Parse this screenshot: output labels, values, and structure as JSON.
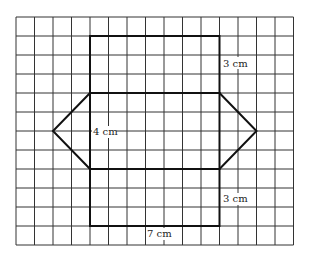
{
  "grid": {
    "columns": 15,
    "rows": 12,
    "origin_x": 16,
    "origin_y": 17,
    "cell_w": 18.5,
    "cell_h": 19,
    "line_color": "#333333"
  },
  "net": {
    "line_color": "#111111",
    "top_rect": {
      "col": 4,
      "row": 1,
      "w": 7,
      "h": 3
    },
    "middle_rect": {
      "col": 4,
      "row": 4,
      "w": 7,
      "h": 4
    },
    "bottom_rect": {
      "col": 4,
      "row": 8,
      "w": 7,
      "h": 3
    },
    "left_apex": {
      "col": 2,
      "row": 6
    },
    "right_apex": {
      "col": 13,
      "row": 6
    }
  },
  "labels": {
    "top_height": "3 cm",
    "middle_height": "4 cm",
    "bottom_height": "3 cm",
    "width": "7 cm"
  }
}
